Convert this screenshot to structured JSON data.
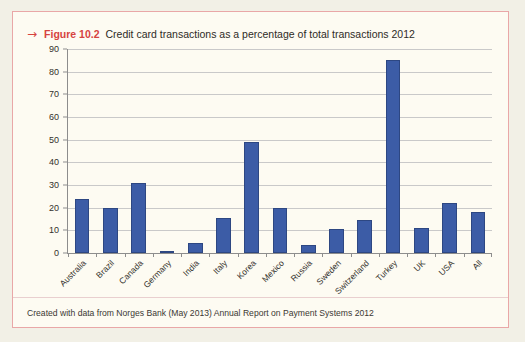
{
  "figure": {
    "arrow_glyph": "→",
    "number": "Figure 10.2",
    "title": "Credit card transactions as a percentage of total transactions 2012"
  },
  "footer": {
    "note": "Created with data from Norges Bank (May 2013) Annual Report on Payment Systems 2012"
  },
  "colors": {
    "bar_fill": "#3c5ca6",
    "bar_stroke": "#2d4782",
    "card_background": "#fdfbf2",
    "card_border": "#e9a7a7",
    "page_background": "#f2f0e6",
    "caption_accent": "#d6433f",
    "gridline": "#c9c9c9",
    "axis": "#8d8d8d"
  },
  "chart_data": {
    "type": "bar",
    "title": "Credit card transactions as a percentage of total transactions 2012",
    "xlabel": "",
    "ylabel": "",
    "ylim": [
      0,
      90
    ],
    "yticks": [
      0,
      10,
      20,
      30,
      40,
      50,
      60,
      70,
      80,
      90
    ],
    "ytick_labels": [
      "0",
      "10",
      "20",
      "30",
      "40",
      "50",
      "60",
      "70",
      "80",
      "90"
    ],
    "grid": true,
    "legend": false,
    "categories": [
      "Australia",
      "Brazil",
      "Canada",
      "Germany",
      "India",
      "Italy",
      "Korea",
      "Mexico",
      "Russia",
      "Sweden",
      "Switzerland",
      "Turkey",
      "UK",
      "USA",
      "All"
    ],
    "values": [
      24,
      20,
      31,
      0.5,
      4.5,
      15.5,
      49,
      20,
      3.5,
      10.5,
      14.5,
      85,
      11,
      22,
      18
    ]
  }
}
